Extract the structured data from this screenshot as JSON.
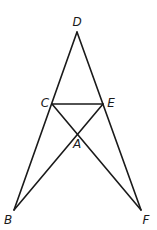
{
  "diagram": {
    "type": "geometry-figure",
    "points": {
      "D": {
        "label": "D",
        "x": 77,
        "y": 32,
        "label_x": 77,
        "label_y": 22
      },
      "C": {
        "label": "C",
        "x": 52,
        "y": 104,
        "label_x": 45,
        "label_y": 103
      },
      "E": {
        "label": "E",
        "x": 103,
        "y": 104,
        "label_x": 111,
        "label_y": 103
      },
      "A": {
        "label": "A",
        "x": 77,
        "y": 132,
        "label_x": 77,
        "label_y": 144
      },
      "B": {
        "label": "B",
        "x": 14,
        "y": 210,
        "label_x": 8,
        "label_y": 220
      },
      "F": {
        "label": "F",
        "x": 141,
        "y": 210,
        "label_x": 146,
        "label_y": 220
      }
    },
    "segments": [
      {
        "name": "DB",
        "from": "D",
        "to": "B"
      },
      {
        "name": "DF",
        "from": "D",
        "to": "F"
      },
      {
        "name": "CE",
        "from": "C",
        "to": "E"
      },
      {
        "name": "CF",
        "from": "C",
        "to": "F"
      },
      {
        "name": "EB",
        "from": "E",
        "to": "B"
      }
    ],
    "colors": {
      "stroke": "#1a1a1a",
      "background": "#ffffff"
    }
  }
}
